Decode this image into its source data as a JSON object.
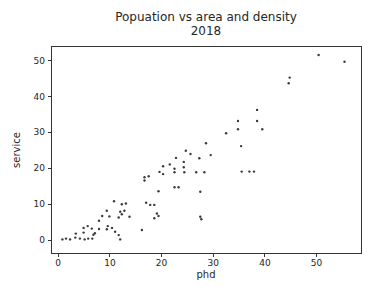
{
  "figure": {
    "background": "#ffffff"
  },
  "chart_data": {
    "type": "scatter",
    "title": "Popuation vs area and density",
    "subtitle": "2018",
    "xlabel": "phd",
    "ylabel": "service",
    "xlim": [
      -1.4,
      58.6
    ],
    "ylim": [
      -3.6,
      54.1
    ],
    "xticks": [
      0,
      10,
      20,
      30,
      40,
      50
    ],
    "yticks": [
      0,
      10,
      20,
      30,
      40,
      50
    ],
    "grid": false,
    "marker_color": "#3a3a3a",
    "marker_size": 1.2,
    "axis_color": "#333333",
    "text_color": "#262626",
    "points": [
      [
        0.8,
        0.2
      ],
      [
        1.5,
        0.4
      ],
      [
        2.3,
        0.2
      ],
      [
        3.3,
        0.7
      ],
      [
        4.2,
        0.4
      ],
      [
        5.1,
        0.2
      ],
      [
        5.8,
        0.4
      ],
      [
        6.6,
        0.4
      ],
      [
        3.4,
        1.8
      ],
      [
        4.9,
        2.1
      ],
      [
        6.8,
        1.5
      ],
      [
        7.1,
        1.9
      ],
      [
        11.0,
        2.3
      ],
      [
        11.7,
        1.4
      ],
      [
        12.0,
        0.2
      ],
      [
        16.2,
        2.8
      ],
      [
        4.9,
        3.4
      ],
      [
        5.7,
        3.9
      ],
      [
        6.5,
        3.2
      ],
      [
        7.9,
        3.1
      ],
      [
        9.4,
        3.0
      ],
      [
        9.6,
        3.9
      ],
      [
        10.4,
        3.4
      ],
      [
        7.9,
        5.4
      ],
      [
        8.5,
        6.7
      ],
      [
        9.9,
        6.6
      ],
      [
        11.7,
        6.3
      ],
      [
        12.3,
        7.2
      ],
      [
        12.0,
        7.9
      ],
      [
        12.8,
        8.2
      ],
      [
        9.4,
        8.2
      ],
      [
        13.8,
        6.5
      ],
      [
        10.8,
        10.8
      ],
      [
        12.3,
        10.0
      ],
      [
        13.1,
        10.2
      ],
      [
        17.0,
        10.4
      ],
      [
        17.8,
        9.8
      ],
      [
        18.6,
        9.8
      ],
      [
        18.6,
        6.1
      ],
      [
        19.1,
        7.4
      ],
      [
        19.4,
        6.7
      ],
      [
        27.5,
        6.5
      ],
      [
        27.7,
        5.8
      ],
      [
        19.4,
        13.6
      ],
      [
        22.5,
        14.7
      ],
      [
        23.3,
        14.7
      ],
      [
        27.5,
        13.5
      ],
      [
        16.7,
        16.6
      ],
      [
        16.7,
        17.5
      ],
      [
        17.5,
        17.8
      ],
      [
        19.6,
        19.0
      ],
      [
        20.3,
        18.4
      ],
      [
        22.5,
        18.9
      ],
      [
        24.4,
        18.9
      ],
      [
        26.7,
        18.9
      ],
      [
        28.3,
        18.9
      ],
      [
        35.5,
        19.1
      ],
      [
        37.0,
        19.1
      ],
      [
        37.9,
        19.1
      ],
      [
        20.3,
        20.6
      ],
      [
        21.6,
        21.1
      ],
      [
        22.5,
        19.9
      ],
      [
        24.3,
        20.3
      ],
      [
        22.8,
        22.9
      ],
      [
        24.3,
        21.8
      ],
      [
        24.7,
        24.9
      ],
      [
        25.6,
        24.0
      ],
      [
        27.3,
        22.8
      ],
      [
        29.5,
        23.7
      ],
      [
        28.6,
        27.0
      ],
      [
        35.4,
        26.2
      ],
      [
        32.5,
        29.8
      ],
      [
        34.8,
        30.9
      ],
      [
        39.5,
        30.9
      ],
      [
        34.8,
        33.2
      ],
      [
        38.5,
        33.2
      ],
      [
        38.5,
        36.3
      ],
      [
        44.6,
        43.7
      ],
      [
        44.8,
        45.3
      ],
      [
        50.4,
        51.6
      ],
      [
        55.4,
        49.7
      ]
    ]
  },
  "layout": {
    "plot_left": 51,
    "plot_top": 46,
    "plot_width": 310,
    "plot_height": 207,
    "svg_width": 379,
    "svg_height": 296
  }
}
